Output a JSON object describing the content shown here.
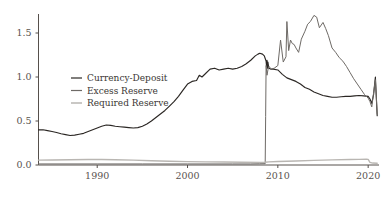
{
  "chart_data": {
    "type": "line",
    "title": "",
    "subtitle": "",
    "xlabel": "",
    "ylabel": "",
    "xlim": [
      1983.5,
      2021.2
    ],
    "ylim": [
      0.0,
      1.78
    ],
    "grid": false,
    "legend_position": "center-left",
    "x_ticks": [
      1990,
      2000,
      2010,
      2020
    ],
    "x_tick_labels": [
      "1990",
      "2000",
      "2010",
      "2020"
    ],
    "y_ticks": [
      0.0,
      0.5,
      1.0,
      1.5
    ],
    "y_tick_labels": [
      "0.0",
      "0.5",
      "1.0",
      "1.5"
    ],
    "colors": {
      "currency_deposit": "#2b2724",
      "excess_reserve": "#6e6a66",
      "required_reserve": "#b9b6b2",
      "axis": "#56504c",
      "text": "#59534f",
      "background": "#ffffff"
    },
    "series": [
      {
        "name": "Currency-Deposit",
        "color": "#2b2724",
        "x": [
          1983.5,
          1984.0,
          1984.5,
          1985.0,
          1985.5,
          1986.0,
          1986.5,
          1987.0,
          1987.5,
          1988.0,
          1988.5,
          1989.0,
          1989.5,
          1990.0,
          1990.5,
          1991.0,
          1991.5,
          1992.0,
          1992.5,
          1993.0,
          1993.5,
          1994.0,
          1994.5,
          1995.0,
          1995.5,
          1996.0,
          1996.5,
          1997.0,
          1997.5,
          1998.0,
          1998.5,
          1999.0,
          1999.5,
          2000.0,
          2000.5,
          2001.0,
          2001.3,
          2001.6,
          2002.0,
          2002.5,
          2003.0,
          2003.5,
          2004.0,
          2004.5,
          2005.0,
          2005.5,
          2006.0,
          2006.5,
          2007.0,
          2007.5,
          2007.8,
          2008.0,
          2008.3,
          2008.5,
          2008.6,
          2008.7,
          2008.75,
          2008.8,
          2008.85,
          2008.9,
          2009.0,
          2009.2,
          2009.5,
          2010.0,
          2010.5,
          2011.0,
          2011.5,
          2012.0,
          2012.5,
          2013.0,
          2013.5,
          2014.0,
          2014.5,
          2015.0,
          2015.5,
          2016.0,
          2016.5,
          2017.0,
          2017.5,
          2018.0,
          2018.5,
          2019.0,
          2019.5,
          2020.0,
          2020.2,
          2020.4,
          2020.6,
          2020.8,
          2021.0
        ],
        "y": [
          0.4,
          0.4,
          0.39,
          0.38,
          0.37,
          0.355,
          0.345,
          0.335,
          0.34,
          0.35,
          0.36,
          0.38,
          0.4,
          0.42,
          0.44,
          0.455,
          0.45,
          0.44,
          0.435,
          0.43,
          0.425,
          0.42,
          0.425,
          0.44,
          0.465,
          0.5,
          0.54,
          0.58,
          0.62,
          0.67,
          0.72,
          0.78,
          0.85,
          0.92,
          0.95,
          0.96,
          1.02,
          1.0,
          1.04,
          1.09,
          1.1,
          1.08,
          1.09,
          1.1,
          1.09,
          1.1,
          1.12,
          1.15,
          1.19,
          1.24,
          1.26,
          1.27,
          1.26,
          1.24,
          1.21,
          1.18,
          1.12,
          1.19,
          1.1,
          1.17,
          1.1,
          1.09,
          1.09,
          1.08,
          1.03,
          0.99,
          0.97,
          0.95,
          0.92,
          0.88,
          0.86,
          0.83,
          0.81,
          0.79,
          0.78,
          0.77,
          0.77,
          0.775,
          0.78,
          0.78,
          0.785,
          0.79,
          0.785,
          0.78,
          0.75,
          0.7,
          0.8,
          1.0,
          0.56
        ]
      },
      {
        "name": "Excess Reserve",
        "color": "#6e6a66",
        "x": [
          1983.5,
          1990.0,
          1995.0,
          2000.0,
          2005.0,
          2007.0,
          2008.0,
          2008.6,
          2008.65,
          2008.7,
          2008.8,
          2008.9,
          2009.0,
          2009.3,
          2009.6,
          2010.0,
          2010.3,
          2010.6,
          2010.9,
          2011.0,
          2011.2,
          2011.4,
          2011.6,
          2011.8,
          2012.0,
          2012.3,
          2012.6,
          2013.0,
          2013.3,
          2013.6,
          2014.0,
          2014.3,
          2014.6,
          2015.0,
          2015.3,
          2015.6,
          2016.0,
          2016.4,
          2016.8,
          2017.2,
          2017.6,
          2018.0,
          2018.4,
          2018.8,
          2019.2,
          2019.6,
          2020.0,
          2020.2,
          2020.4,
          2020.6,
          2020.8,
          2021.0
        ],
        "y": [
          0.012,
          0.012,
          0.012,
          0.012,
          0.012,
          0.012,
          0.014,
          0.015,
          0.55,
          1.13,
          1.02,
          1.08,
          1.12,
          1.09,
          1.1,
          1.13,
          1.42,
          1.17,
          1.23,
          1.63,
          1.3,
          1.42,
          1.38,
          1.37,
          1.33,
          1.28,
          1.43,
          1.52,
          1.6,
          1.63,
          1.7,
          1.68,
          1.56,
          1.62,
          1.55,
          1.47,
          1.33,
          1.28,
          1.22,
          1.18,
          1.12,
          1.05,
          0.98,
          0.92,
          0.86,
          0.8,
          0.76,
          0.72,
          0.66,
          0.82,
          0.97,
          0.58
        ]
      },
      {
        "name": "Required Reserve",
        "color": "#b9b6b2",
        "x": [
          1983.5,
          1985.0,
          1987.0,
          1989.0,
          1990.5,
          1992.0,
          1994.0,
          1996.0,
          1998.0,
          2000.0,
          2002.0,
          2004.0,
          2006.0,
          2008.0,
          2008.6,
          2009.0,
          2010.0,
          2012.0,
          2014.0,
          2016.0,
          2018.0,
          2019.0,
          2019.8,
          2020.0,
          2020.2,
          2020.5,
          2021.0
        ],
        "y": [
          0.055,
          0.057,
          0.06,
          0.062,
          0.063,
          0.06,
          0.055,
          0.048,
          0.042,
          0.038,
          0.036,
          0.034,
          0.032,
          0.03,
          0.032,
          0.036,
          0.04,
          0.046,
          0.052,
          0.058,
          0.062,
          0.064,
          0.065,
          0.064,
          0.03,
          0.022,
          0.02
        ]
      }
    ],
    "legend": [
      {
        "label": "Currency-Deposit",
        "color": "#2b2724"
      },
      {
        "label": "Excess Reserve",
        "color": "#6e6a66"
      },
      {
        "label": "Required Reserve",
        "color": "#b9b6b2"
      }
    ]
  }
}
